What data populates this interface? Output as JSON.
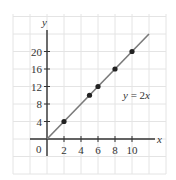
{
  "chart_data": {
    "type": "line",
    "title": "",
    "xlabel": "x",
    "ylabel": "y",
    "x_ticks": [
      2,
      4,
      6,
      8,
      10
    ],
    "y_ticks": [
      4,
      8,
      12,
      16,
      20
    ],
    "origin_label": "0",
    "xlim": [
      -3,
      13
    ],
    "ylim": [
      -8,
      28
    ],
    "grid": true,
    "series": [
      {
        "name": "y = 2x",
        "line": {
          "x": [
            0,
            12
          ],
          "y": [
            0,
            24
          ]
        },
        "points": {
          "x": [
            2,
            5,
            6,
            8,
            10
          ],
          "y": [
            4,
            10,
            12,
            16,
            20
          ]
        }
      }
    ],
    "annotations": [
      {
        "text": "y = 2x",
        "x": 9,
        "y": 9.5
      }
    ]
  },
  "labels": {
    "x_axis": "x",
    "y_axis": "y",
    "origin": "0",
    "equation_var": "y",
    "equation_eq": " = 2",
    "equation_x": "x"
  },
  "colors": {
    "line": "#7a7a7a",
    "points": "#222222",
    "axis": "#333333",
    "grid": "#e4e4e4"
  }
}
